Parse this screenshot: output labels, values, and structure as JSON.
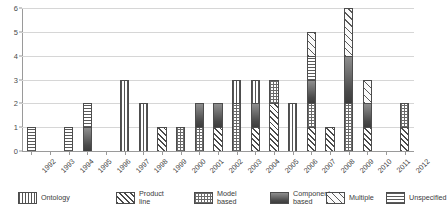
{
  "chart_data": {
    "type": "bar",
    "stacked": true,
    "title": "",
    "subtitle": "",
    "xlabel": "",
    "ylabel": "",
    "ylim": [
      0,
      6
    ],
    "ytick_values": [
      0,
      1,
      2,
      3,
      4,
      5,
      6
    ],
    "ytick_labels": [
      "0",
      "1",
      "2",
      "3",
      "4",
      "5",
      "6"
    ],
    "grid": "horizontal",
    "legend_position": "bottom",
    "categories": [
      "1992",
      "1993",
      "1994",
      "1995",
      "1996",
      "1997",
      "1998",
      "1999",
      "2000",
      "2001",
      "2002",
      "2003",
      "2004",
      "2005",
      "2006",
      "2007",
      "2008",
      "2009",
      "2010",
      "2011",
      "2012"
    ],
    "series": [
      {
        "name": "Ontology",
        "pattern": "vertical-stripes",
        "values": [
          0,
          0,
          0,
          0,
          0,
          3,
          2,
          0,
          0,
          0,
          0,
          1,
          1,
          0,
          2,
          0,
          0,
          0,
          0,
          0,
          0
        ]
      },
      {
        "name": "Product line",
        "pattern": "diagonal-hatch-dense",
        "values": [
          0,
          0,
          0,
          0,
          0,
          0,
          0,
          1,
          0,
          0,
          1,
          0,
          1,
          2,
          0,
          1,
          1,
          0,
          1,
          0,
          1
        ]
      },
      {
        "name": "Model based",
        "pattern": "checkerboard",
        "values": [
          0,
          0,
          0,
          0,
          0,
          0,
          0,
          0,
          1,
          1,
          0,
          2,
          0,
          1,
          0,
          1,
          0,
          2,
          0,
          0,
          1
        ]
      },
      {
        "name": "Component based",
        "pattern": "solid-dark-gradient",
        "values": [
          0,
          0,
          0,
          1,
          0,
          0,
          0,
          0,
          0,
          1,
          1,
          0,
          1,
          0,
          0,
          1,
          0,
          2,
          1,
          0,
          0
        ]
      },
      {
        "name": "Multiple",
        "pattern": "diagonal-hatch-wide",
        "values": [
          0,
          0,
          0,
          0,
          0,
          0,
          0,
          0,
          0,
          0,
          0,
          0,
          0,
          0,
          0,
          1,
          0,
          2,
          1,
          0,
          0
        ]
      },
      {
        "name": "Unspecified",
        "pattern": "horizontal-stripes",
        "values": [
          1,
          0,
          1,
          1,
          0,
          0,
          0,
          0,
          0,
          0,
          0,
          0,
          0,
          0,
          0,
          1,
          0,
          0,
          0,
          0,
          0
        ]
      }
    ],
    "totals": [
      1,
      0,
      1,
      2,
      0,
      3,
      2,
      1,
      1,
      2,
      2,
      3,
      3,
      3,
      2,
      5,
      1,
      6,
      3,
      0,
      2
    ],
    "stack_order_bottom_to_top": {
      "1992": [
        {
          "series": "Unspecified",
          "value": 1
        }
      ],
      "1994": [
        {
          "series": "Unspecified",
          "value": 1
        }
      ],
      "1995": [
        {
          "series": "Component based",
          "value": 1
        },
        {
          "series": "Unspecified",
          "value": 1
        }
      ],
      "1997": [
        {
          "series": "Ontology",
          "value": 3
        }
      ],
      "1998": [
        {
          "series": "Ontology",
          "value": 2
        }
      ],
      "1999": [
        {
          "series": "Product line",
          "value": 1
        }
      ],
      "2000": [
        {
          "series": "Model based",
          "value": 1
        }
      ],
      "2001": [
        {
          "series": "Model based",
          "value": 1
        },
        {
          "series": "Component based",
          "value": 1
        }
      ],
      "2002": [
        {
          "series": "Product line",
          "value": 1
        },
        {
          "series": "Component based",
          "value": 1
        }
      ],
      "2003": [
        {
          "series": "Model based",
          "value": 2
        },
        {
          "series": "Ontology",
          "value": 1
        }
      ],
      "2004": [
        {
          "series": "Product line",
          "value": 1
        },
        {
          "series": "Component based",
          "value": 1
        },
        {
          "series": "Ontology",
          "value": 1
        }
      ],
      "2005": [
        {
          "series": "Product line",
          "value": 2
        },
        {
          "series": "Model based",
          "value": 1
        }
      ],
      "2006": [
        {
          "series": "Ontology",
          "value": 2
        }
      ],
      "2007": [
        {
          "series": "Product line",
          "value": 1
        },
        {
          "series": "Model based",
          "value": 1
        },
        {
          "series": "Component based",
          "value": 1
        },
        {
          "series": "Unspecified",
          "value": 1
        },
        {
          "series": "Multiple",
          "value": 1
        }
      ],
      "2008": [
        {
          "series": "Product line",
          "value": 1
        }
      ],
      "2009": [
        {
          "series": "Model based",
          "value": 2
        },
        {
          "series": "Component based",
          "value": 2
        },
        {
          "series": "Multiple",
          "value": 2
        }
      ],
      "2010": [
        {
          "series": "Product line",
          "value": 1
        },
        {
          "series": "Component based",
          "value": 1
        },
        {
          "series": "Multiple",
          "value": 1
        }
      ],
      "2012": [
        {
          "series": "Product line",
          "value": 1
        },
        {
          "series": "Model based",
          "value": 1
        }
      ]
    }
  },
  "legend": {
    "items": [
      {
        "label": "Ontology",
        "pattern_class": "pat-ontology",
        "name": "legend-item-ontology"
      },
      {
        "label": "Product\nline",
        "pattern_class": "pat-productline",
        "name": "legend-item-product-line"
      },
      {
        "label": "Model\nbased",
        "pattern_class": "pat-modelbased",
        "name": "legend-item-model-based"
      },
      {
        "label": "Component\nbased",
        "pattern_class": "pat-component",
        "name": "legend-item-component-based"
      },
      {
        "label": "Multiple",
        "pattern_class": "pat-multiple",
        "name": "legend-item-multiple"
      },
      {
        "label": "Unspecified",
        "pattern_class": "pat-unspecified",
        "name": "legend-item-unspecified"
      }
    ]
  },
  "colors": {
    "grid": "#d6d6d6",
    "axis": "#9a9a9a",
    "bar_outline": "#4d4d4d",
    "text": "#3a3a3a",
    "background": "#ffffff"
  }
}
